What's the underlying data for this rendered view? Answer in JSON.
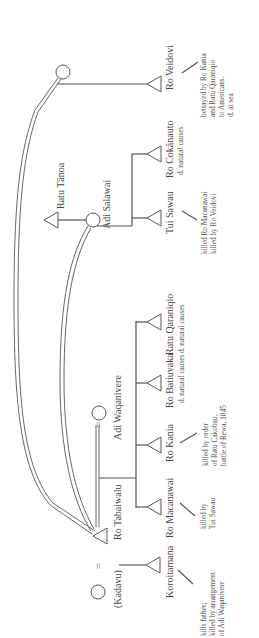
{
  "diagram": {
    "type": "genealogy-kinship-chart",
    "orientation": "rotated-90-counterclockwise",
    "colors": {
      "line": "#555555",
      "text": "#444444",
      "background": "#ffffff"
    },
    "marriage_symbol": "=",
    "persons": {
      "kadavu": {
        "name": "(Kadavu)",
        "sex": "female",
        "symbol": "circle"
      },
      "ro_tabaiwalu": {
        "name": "Ro Tabaiwalu",
        "sex": "male",
        "symbol": "triangle"
      },
      "adi_waqanivere": {
        "name": "Adi Waqanivere",
        "sex": "female",
        "symbol": "circle"
      },
      "koroitamana": {
        "name": "Koroitamana",
        "sex": "male",
        "symbol": "triangle",
        "notes": [
          "kills father;",
          "killed by arrangement",
          "of Adi Waqanivere"
        ]
      },
      "ro_macanawai": {
        "name": "Ro Macanawai",
        "sex": "male",
        "symbol": "triangle",
        "notes": [
          "killed by",
          "Tui Sawau"
        ]
      },
      "ro_kania": {
        "name": "Ro Kania",
        "sex": "male",
        "symbol": "triangle",
        "notes": [
          "killed by order",
          "of Ratu Cakobau,",
          "battle of Rewa, 1845"
        ]
      },
      "ro_batiuvaka": {
        "name": "Ro Batiuvaka",
        "sex": "male",
        "symbol": "triangle",
        "notes": [
          "d. natural causes"
        ]
      },
      "ratu_qaraniqio": {
        "name": "Ratu Qaraniqio",
        "sex": "male",
        "symbol": "triangle",
        "notes": [
          "d. natural causes"
        ]
      },
      "ratu_tanoa": {
        "name": "Ratu Tānoa",
        "sex": "male",
        "symbol": "triangle"
      },
      "adi_salawai": {
        "name": "Adi Salawai",
        "sex": "female",
        "symbol": "circle"
      },
      "tui_sawau": {
        "name": "Tui Sawau",
        "sex": "male",
        "symbol": "triangle",
        "notes": [
          "killed Ro Macanawai",
          "killed by Ro Veidovi"
        ]
      },
      "ro_cokanauto": {
        "name": "Ro Cokānauto",
        "sex": "male",
        "symbol": "triangle",
        "notes": [
          "d. natural causes"
        ]
      },
      "unnamed_wife": {
        "name": "",
        "sex": "female",
        "symbol": "circle"
      },
      "ro_veidovi": {
        "name": "Ro Veidovi",
        "sex": "male",
        "symbol": "triangle",
        "notes": [
          "betrayed by Ro Kania",
          "and Ratu Qaraniqio",
          "to Americans.",
          "d. at sea"
        ]
      }
    },
    "relations": [
      {
        "type": "marriage",
        "a": "kadavu",
        "b": "ro_tabaiwalu"
      },
      {
        "type": "marriage",
        "a": "ro_tabaiwalu",
        "b": "adi_waqanivere"
      },
      {
        "type": "marriage",
        "a": "ro_tabaiwalu",
        "b": "adi_salawai"
      },
      {
        "type": "marriage",
        "a": "ro_tabaiwalu",
        "b": "unnamed_wife"
      },
      {
        "type": "marriage",
        "a": "ratu_tanoa",
        "b": "adi_salawai"
      },
      {
        "type": "descent",
        "parents": [
          "kadavu",
          "ro_tabaiwalu"
        ],
        "children": [
          "koroitamana"
        ]
      },
      {
        "type": "descent",
        "parents": [
          "ro_tabaiwalu",
          "adi_waqanivere"
        ],
        "children": [
          "ro_macanawai",
          "ro_kania",
          "ro_batiuvaka",
          "ratu_qaraniqio"
        ]
      },
      {
        "type": "descent",
        "parents": [
          "adi_salawai"
        ],
        "children": [
          "tui_sawau",
          "ro_cokanauto"
        ]
      },
      {
        "type": "descent",
        "parents": [
          "unnamed_wife"
        ],
        "children": [
          "ro_veidovi"
        ]
      }
    ]
  }
}
